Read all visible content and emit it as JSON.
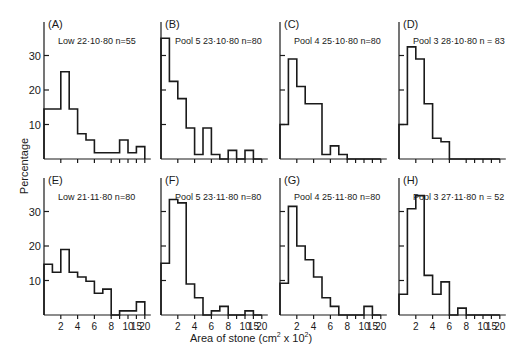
{
  "chart_data": {
    "type": "bar",
    "subtype": "histogram-grid",
    "title": "",
    "xlabel": "Area of stone (cm² x 10²)",
    "ylabel": "Percentage",
    "ylim": [
      0,
      38
    ],
    "yticks": [
      10,
      20,
      30
    ],
    "x_slots": [
      "0",
      "1",
      "2",
      "3",
      "4",
      "5",
      "6",
      "7",
      "8",
      "9",
      "10",
      "15",
      "20"
    ],
    "x_tick_slots": [
      2,
      4,
      6,
      8,
      9,
      10,
      11,
      12
    ],
    "x_tick_labels": {
      "2": "2",
      "4": "4",
      "6": "6",
      "8": "8",
      "10": "10",
      "11": "15",
      "12": "20"
    },
    "grid": false,
    "panels": [
      {
        "id": "A",
        "label": "(A)",
        "site": "Low",
        "date": "22·10·80",
        "n": "n=55",
        "bins": [
          [
            0,
            2,
            14.5
          ],
          [
            2,
            3,
            25.3
          ],
          [
            3,
            4,
            14.5
          ],
          [
            4,
            5,
            7.3
          ],
          [
            5,
            6,
            5.5
          ],
          [
            6,
            9,
            1.8
          ],
          [
            9,
            10,
            5.5
          ],
          [
            10,
            11,
            1.8
          ],
          [
            11,
            12,
            3.6
          ]
        ]
      },
      {
        "id": "B",
        "label": "(B)",
        "site": "Pool 5",
        "date": "23·10·80",
        "n": "n=80",
        "bins": [
          [
            0,
            1,
            35
          ],
          [
            1,
            2,
            22.5
          ],
          [
            2,
            3,
            17.5
          ],
          [
            3,
            4,
            9
          ],
          [
            4,
            5,
            1.3
          ],
          [
            5,
            6,
            9
          ],
          [
            6,
            7,
            1.3
          ],
          [
            7,
            8,
            0
          ],
          [
            8,
            9,
            2.5
          ],
          [
            9,
            10,
            0
          ],
          [
            10,
            11,
            2.5
          ],
          [
            11,
            12,
            0
          ]
        ]
      },
      {
        "id": "C",
        "label": "(C)",
        "site": "Pool 4",
        "date": "25·10·80",
        "n": "n=80",
        "bins": [
          [
            0,
            1,
            10
          ],
          [
            1,
            2,
            29
          ],
          [
            2,
            3,
            21
          ],
          [
            3,
            5,
            16
          ],
          [
            5,
            6,
            1.3
          ],
          [
            6,
            7,
            3.8
          ],
          [
            7,
            8,
            1.3
          ],
          [
            8,
            12,
            0
          ]
        ]
      },
      {
        "id": "D",
        "label": "(D)",
        "site": "Pool 3",
        "date": "28·10·80",
        "n": "n = 83",
        "bins": [
          [
            0,
            1,
            10
          ],
          [
            1,
            2,
            32.5
          ],
          [
            2,
            3,
            29
          ],
          [
            3,
            4,
            16
          ],
          [
            4,
            5,
            6
          ],
          [
            5,
            6,
            5
          ],
          [
            6,
            12,
            0
          ]
        ]
      },
      {
        "id": "E",
        "label": "(E)",
        "site": "Low",
        "date": "21·11·80",
        "n": "n=80",
        "bins": [
          [
            0,
            1,
            14.7
          ],
          [
            1,
            2,
            12.4
          ],
          [
            2,
            3,
            19
          ],
          [
            3,
            4,
            12.4
          ],
          [
            4,
            5,
            11
          ],
          [
            5,
            6,
            9.8
          ],
          [
            6,
            7,
            6.3
          ],
          [
            7,
            8,
            7.5
          ],
          [
            8,
            9,
            0
          ],
          [
            9,
            11,
            1.2
          ],
          [
            11,
            12,
            3.8
          ]
        ]
      },
      {
        "id": "F",
        "label": "(F)",
        "site": "Pool 5",
        "date": "23·11·80",
        "n": "n=80",
        "bins": [
          [
            0,
            1,
            15
          ],
          [
            1,
            2,
            33.5
          ],
          [
            2,
            3,
            32.5
          ],
          [
            3,
            4,
            9
          ],
          [
            4,
            5,
            5
          ],
          [
            5,
            6,
            0
          ],
          [
            6,
            7,
            1.2
          ],
          [
            7,
            8,
            2.5
          ],
          [
            8,
            10,
            0
          ],
          [
            10,
            11,
            1.2
          ],
          [
            11,
            12,
            0
          ]
        ]
      },
      {
        "id": "G",
        "label": "(G)",
        "site": "Pool 4",
        "date": "25·11·80",
        "n": "n=80",
        "bins": [
          [
            0,
            1,
            9.2
          ],
          [
            1,
            2,
            31.5
          ],
          [
            2,
            3,
            20
          ],
          [
            3,
            4,
            16
          ],
          [
            4,
            5,
            11
          ],
          [
            5,
            6,
            5
          ],
          [
            6,
            7,
            2.5
          ],
          [
            7,
            10,
            0
          ],
          [
            10,
            11,
            2.5
          ],
          [
            11,
            12,
            0
          ]
        ]
      },
      {
        "id": "H",
        "label": "(H)",
        "site": "Pool 3",
        "date": "27·11·80",
        "n": "n = 52",
        "bins": [
          [
            0,
            1,
            6
          ],
          [
            1,
            2,
            30.8
          ],
          [
            2,
            3,
            34.6
          ],
          [
            3,
            4,
            11.5
          ],
          [
            4,
            5,
            6
          ],
          [
            5,
            6,
            9.6
          ],
          [
            6,
            7,
            0
          ],
          [
            7,
            8,
            2
          ],
          [
            8,
            12,
            0
          ]
        ]
      }
    ]
  },
  "axes": {
    "ylabel": "Percentage",
    "xlabel_main": "Area of stone ",
    "xlabel_unit_pre": "(cm",
    "xlabel_sup1": "2",
    "xlabel_mid": " x 10",
    "xlabel_sup2": "2",
    "xlabel_post": ")"
  }
}
